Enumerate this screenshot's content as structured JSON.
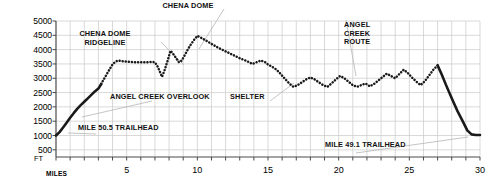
{
  "chart_data": {
    "type": "line",
    "title": "",
    "xlabel": "MILES",
    "ylabel": "FT",
    "xlim": [
      0,
      30
    ],
    "ylim": [
      250,
      5000
    ],
    "grid": true,
    "legend": false,
    "x_ticks_major": [
      5,
      10,
      15,
      20,
      25,
      30
    ],
    "x_tick_labels": [
      "5",
      "10",
      "15",
      "20",
      "25",
      "30"
    ],
    "x_ticks_minor_step": 1,
    "y_ticks": [
      500,
      1000,
      1500,
      2000,
      2500,
      3000,
      3500,
      4000,
      4500,
      5000
    ],
    "y_tick_labels": [
      "500",
      "1000",
      "1500",
      "2000",
      "2500",
      "3000",
      "3500",
      "4000",
      "4500",
      "5000"
    ],
    "series": [
      {
        "name": "Chena Dome Trail elevation profile",
        "style": "dotted",
        "color": "#1a1a1a",
        "x": [
          0,
          0.25,
          0.5,
          0.75,
          1,
          1.25,
          1.5,
          1.75,
          2,
          2.25,
          2.5,
          2.75,
          3,
          3.2,
          3.4,
          3.6,
          3.8,
          4,
          4.2,
          4.4,
          4.6,
          4.8,
          5,
          5.25,
          5.5,
          5.75,
          6,
          6.25,
          6.5,
          6.75,
          7,
          7.2,
          7.5,
          7.7,
          7.9,
          8.1,
          8.25,
          8.5,
          8.7,
          8.9,
          9.1,
          9.3,
          9.5,
          9.75,
          10,
          10.25,
          10.5,
          10.75,
          11,
          11.5,
          12,
          12.5,
          13,
          13.5,
          13.9,
          14.2,
          14.5,
          14.8,
          15,
          15.3,
          15.6,
          15.9,
          16.2,
          16.5,
          16.8,
          17.1,
          17.4,
          17.7,
          18,
          18.3,
          18.6,
          18.9,
          19.2,
          19.5,
          19.8,
          20.1,
          20.4,
          20.7,
          21,
          21.3,
          21.6,
          21.9,
          22.2,
          22.5,
          22.8,
          23.1,
          23.4,
          23.7,
          24,
          24.3,
          24.6,
          24.9,
          25.2,
          25.5,
          25.8,
          26.1,
          26.4,
          26.7,
          27,
          27.3,
          27.6,
          28,
          28.4,
          28.8,
          29.1,
          29.4,
          29.7,
          30
        ],
        "y": [
          1000,
          1120,
          1280,
          1450,
          1620,
          1780,
          1930,
          2060,
          2180,
          2300,
          2420,
          2540,
          2640,
          2800,
          2980,
          3150,
          3320,
          3480,
          3580,
          3620,
          3600,
          3590,
          3580,
          3570,
          3560,
          3560,
          3560,
          3560,
          3560,
          3570,
          3560,
          3400,
          3050,
          3300,
          3620,
          3960,
          3880,
          3700,
          3560,
          3620,
          3800,
          3980,
          4150,
          4330,
          4480,
          4420,
          4350,
          4280,
          4200,
          4060,
          3940,
          3820,
          3700,
          3600,
          3500,
          3560,
          3620,
          3560,
          3480,
          3400,
          3300,
          3150,
          2980,
          2820,
          2700,
          2760,
          2860,
          2960,
          3030,
          2960,
          2860,
          2760,
          2700,
          2820,
          2960,
          3080,
          3000,
          2880,
          2760,
          2700,
          2760,
          2820,
          2720,
          2800,
          2920,
          3040,
          3160,
          3080,
          3000,
          3150,
          3300,
          3180,
          3020,
          2880,
          2760,
          2900,
          3100,
          3300,
          3450,
          3120,
          2760,
          2300,
          1860,
          1480,
          1180,
          1040,
          1020,
          1020
        ]
      }
    ],
    "annotations": [
      {
        "id": "chena-dome",
        "text": "CHENA DOME",
        "align": "center"
      },
      {
        "id": "chena-dome-ridge",
        "text": "CHENA DOME\nRIDGELINE",
        "align": "center"
      },
      {
        "id": "angel-creek-route",
        "text": "ANGEL\nCREEK\nROUTE",
        "align": "left"
      },
      {
        "id": "angel-creek-overlook",
        "text": "ANGEL CREEK OVERLOOK",
        "align": "left"
      },
      {
        "id": "shelter",
        "text": "SHELTER",
        "align": "left"
      },
      {
        "id": "mile-50-5-trailhead",
        "text": "MILE 50.5 TRAILHEAD",
        "align": "left"
      },
      {
        "id": "mile-49-1-trailhead",
        "text": "MILE 49.1 TRAILHEAD",
        "align": "left"
      }
    ],
    "colors": {
      "line": "#1a1a1a",
      "grid": "#c9c9c9",
      "axis": "#4a4a4a",
      "leader": "#b5b5b5",
      "text": "#111111",
      "background": "#ffffff"
    }
  }
}
